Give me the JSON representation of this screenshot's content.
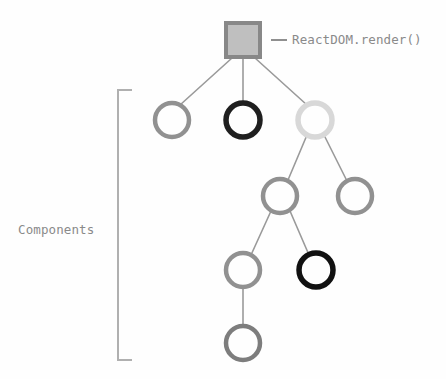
{
  "diagram": {
    "background_color": "#fefefe",
    "labels": {
      "root_label": "ReactDOM.render()",
      "bracket_label": "Components",
      "label_color": "#8a8a8a"
    },
    "palette": {
      "square_stroke": "#888888",
      "square_fill": "#bfbfbf",
      "circle_mid_gray": "#919191",
      "circle_black": "#1f1f1f",
      "circle_light_gray": "#d8d8d8",
      "connector": "#9a9a9a",
      "bracket": "#b0b0b0"
    },
    "root_node": {
      "name": "root-square",
      "shape": "square",
      "cx": 243,
      "cy": 40,
      "size": 34,
      "stroke": "#888888",
      "fill": "#bfbfbf",
      "stroke_width": 4
    },
    "nodes": [
      {
        "id": "n1",
        "row": 1,
        "cx": 172,
        "cy": 120,
        "r": 17,
        "stroke": "#919191",
        "stroke_width": 4.5,
        "shade": "mid-gray"
      },
      {
        "id": "n2",
        "row": 1,
        "cx": 243,
        "cy": 120,
        "r": 17,
        "stroke": "#1f1f1f",
        "stroke_width": 5.5,
        "shade": "black"
      },
      {
        "id": "n3",
        "row": 1,
        "cx": 315,
        "cy": 120,
        "r": 17,
        "stroke": "#d8d8d8",
        "stroke_width": 5.5,
        "shade": "light-gray"
      },
      {
        "id": "n4",
        "row": 2,
        "cx": 280,
        "cy": 196,
        "r": 17,
        "stroke": "#919191",
        "stroke_width": 4.5,
        "shade": "mid-gray"
      },
      {
        "id": "n5",
        "row": 2,
        "cx": 355,
        "cy": 196,
        "r": 17,
        "stroke": "#919191",
        "stroke_width": 4.5,
        "shade": "mid-gray"
      },
      {
        "id": "n6",
        "row": 3,
        "cx": 243,
        "cy": 270,
        "r": 17,
        "stroke": "#919191",
        "stroke_width": 4.5,
        "shade": "mid-gray"
      },
      {
        "id": "n7",
        "row": 3,
        "cx": 316,
        "cy": 270,
        "r": 17,
        "stroke": "#111111",
        "stroke_width": 5.5,
        "shade": "black"
      },
      {
        "id": "n8",
        "row": 4,
        "cx": 243,
        "cy": 343,
        "r": 17,
        "stroke": "#7d7d7d",
        "stroke_width": 4.5,
        "shade": "mid-gray"
      }
    ],
    "edges": [
      {
        "from": "root",
        "to": "n1",
        "x1": 232,
        "y1": 58,
        "x2": 180,
        "y2": 105
      },
      {
        "from": "root",
        "to": "n2",
        "x1": 243,
        "y1": 58,
        "x2": 243,
        "y2": 103
      },
      {
        "from": "root",
        "to": "n3",
        "x1": 255,
        "y1": 58,
        "x2": 307,
        "y2": 105
      },
      {
        "from": "n3",
        "to": "n4",
        "x1": 307,
        "y1": 135,
        "x2": 288,
        "y2": 180
      },
      {
        "from": "n3",
        "to": "n5",
        "x1": 324,
        "y1": 135,
        "x2": 347,
        "y2": 181
      },
      {
        "from": "n4",
        "to": "n6",
        "x1": 271,
        "y1": 211,
        "x2": 251,
        "y2": 255
      },
      {
        "from": "n4",
        "to": "n7",
        "x1": 290,
        "y1": 211,
        "x2": 309,
        "y2": 255
      },
      {
        "from": "n6",
        "to": "n8",
        "x1": 243,
        "y1": 288,
        "x2": 243,
        "y2": 326
      }
    ],
    "bracket": {
      "name": "components-bracket",
      "x": 118,
      "y_top": 90,
      "y_bottom": 360,
      "arm": 14,
      "color": "#b0b0b0",
      "stroke_width": 2
    }
  }
}
